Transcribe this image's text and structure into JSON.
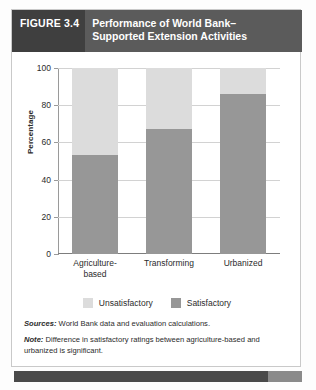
{
  "figure": {
    "number_label": "FIGURE 3.4",
    "title_line1": "Performance of World Bank–",
    "title_line2": "Supported Extension Activities"
  },
  "chart_data": {
    "type": "bar",
    "stacked": true,
    "categories": [
      "Agriculture-based",
      "Transforming",
      "Urbanized"
    ],
    "category_lines": [
      [
        "Agriculture-",
        "based"
      ],
      [
        "Transforming",
        ""
      ],
      [
        "Urbanized",
        ""
      ]
    ],
    "series": [
      {
        "name": "Satisfactory",
        "values": [
          53,
          67,
          86
        ],
        "color": "#979797"
      },
      {
        "name": "Unsatisfactory",
        "values": [
          47,
          33,
          14
        ],
        "color": "#dcdcdc"
      }
    ],
    "xlabel": "",
    "ylabel": "Percentage",
    "ylim": [
      0,
      100
    ],
    "yticks": [
      0,
      20,
      40,
      60,
      80,
      100
    ],
    "ytick_labels": [
      "0",
      "20",
      "40",
      "60",
      "80",
      "100"
    ],
    "grid": true,
    "legend_position": "bottom",
    "legend_order": [
      "Unsatisfactory",
      "Satisfactory"
    ]
  },
  "legend": {
    "items": [
      {
        "label": "Unsatisfactory",
        "color": "#dcdcdc"
      },
      {
        "label": "Satisfactory",
        "color": "#979797"
      }
    ]
  },
  "notes": {
    "sources_key": "Sources:",
    "sources_value": " World Bank data and evaluation calculations.",
    "note_key": "Note:",
    "note_value": " Difference in satisfactory ratings between agriculture-based and urbanized is significant."
  },
  "colors": {
    "title_bar": "#5b5b5b",
    "figure_number_bg": "#3f3f3f",
    "satisfactory": "#979797",
    "unsatisfactory": "#dcdcdc",
    "gridline": "#d2d2d2",
    "footer_bar": "#4a4a4a"
  }
}
